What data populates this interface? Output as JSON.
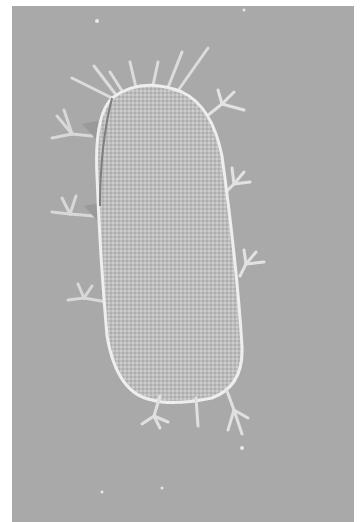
{
  "image": {
    "subject": "tardigrade",
    "description": "Differential interference contrast micrograph of a tardigrade (water bear) on gray background",
    "colors": {
      "background": "#a9a9a9",
      "border": "#ffffff",
      "body_fill": "#bcbcbc",
      "highlight": "#ececec",
      "shadow": "#7e7e7e"
    },
    "legs": 8,
    "head_cirri": 7
  }
}
